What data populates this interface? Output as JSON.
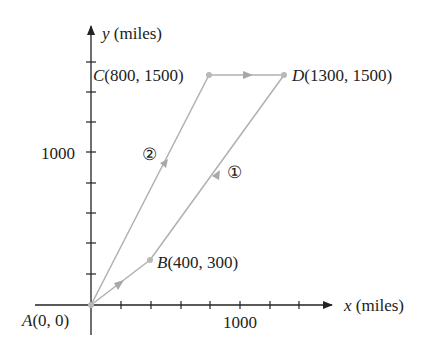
{
  "diagram": {
    "axes": {
      "x_label_var": "x",
      "x_label_unit": " (miles)",
      "y_label_var": "y",
      "y_label_unit": " (miles)",
      "x_tick_label": "1000",
      "y_tick_label": "1000"
    },
    "points": {
      "A": {
        "name": "A",
        "coords": "(0, 0)"
      },
      "B": {
        "name": "B",
        "coords": "(400, 300)"
      },
      "C": {
        "name": "C",
        "coords": "(800, 1500)"
      },
      "D": {
        "name": "D",
        "coords": "(1300, 1500)"
      }
    },
    "routes": {
      "route1": {
        "label": "①",
        "path": [
          "A",
          "B",
          "D"
        ]
      },
      "route2": {
        "label": "②",
        "path": [
          "A",
          "C",
          "D"
        ]
      }
    },
    "colors": {
      "axis": "#222222",
      "path": "#b0b0b0",
      "text": "#222222"
    }
  }
}
